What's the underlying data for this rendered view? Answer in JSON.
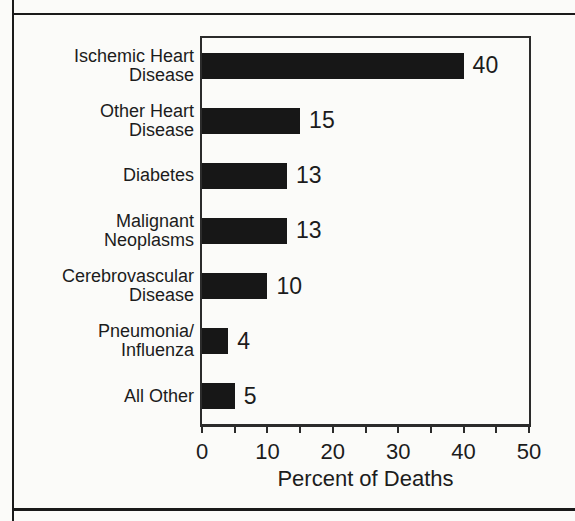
{
  "palette": {
    "paper": "#fbfbf9",
    "ink": "#1c1c1c",
    "line": "#2b2b2b",
    "rule": "#1a1a1a",
    "bar": "#171717"
  },
  "chart_data": {
    "type": "bar",
    "orientation": "horizontal",
    "title": "",
    "xlabel": "Percent of Deaths",
    "ylabel": "",
    "xlim": [
      0,
      50
    ],
    "x_major_ticks": [
      0,
      10,
      20,
      30,
      40,
      50
    ],
    "x_minor_tick_step": 5,
    "grid": false,
    "legend": "none",
    "categories": [
      "Ischemic Heart Disease",
      "Other Heart Disease",
      "Diabetes",
      "Malignant Neoplasms",
      "Cerebrovascular Disease",
      "Pneumonia/Influenza",
      "All Other"
    ],
    "category_lines": [
      [
        "Ischemic Heart",
        "Disease"
      ],
      [
        "Other Heart",
        "Disease"
      ],
      [
        "Diabetes"
      ],
      [
        "Malignant",
        "Neoplasms"
      ],
      [
        "Cerebrovascular",
        "Disease"
      ],
      [
        "Pneumonia/",
        "Influenza"
      ],
      [
        "All Other"
      ]
    ],
    "values": [
      40,
      15,
      13,
      13,
      10,
      4,
      5
    ],
    "value_labels": [
      "40",
      "15",
      "13",
      "13",
      "10",
      "4",
      "5"
    ]
  }
}
